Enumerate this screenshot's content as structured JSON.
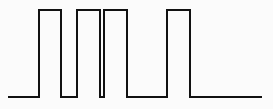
{
  "canvas": {
    "width": 273,
    "height": 109,
    "background_color": "#fbfbfb"
  },
  "figure": {
    "kind": "digital-pulse-waveform",
    "stroke_color": "#111111",
    "stroke_width": 1.6
  },
  "chart_data": {
    "type": "line",
    "title": "",
    "subtitle": "",
    "xlabel": "",
    "ylabel": "",
    "grid": false,
    "legend": null,
    "axis_visible": false,
    "tick_labels_x": [],
    "tick_labels_y": [],
    "xlim": [
      0,
      273
    ],
    "ylim": [
      0,
      109
    ],
    "levels": {
      "low_y": 97,
      "high_y": 10,
      "low_value": 0,
      "high_value": 1
    },
    "trace_start_x": 8,
    "trace_end_x": 262,
    "pulses": [
      {
        "index": 1,
        "rise_x": 39,
        "fall_x": 61,
        "width_px": 22,
        "narrow": false
      },
      {
        "index": 2,
        "rise_x": 77,
        "fall_x": 100,
        "width_px": 23,
        "narrow": false
      },
      {
        "index": 3,
        "rise_x": 104,
        "fall_x": 127,
        "width_px": 23,
        "narrow": false
      },
      {
        "index": 4,
        "rise_x": 167,
        "fall_x": 190,
        "width_px": 23,
        "narrow": false
      }
    ],
    "gaps": [
      {
        "from_x": 8,
        "to_x": 39,
        "width_px": 31,
        "note": "leading low baseline"
      },
      {
        "from_x": 61,
        "to_x": 77,
        "width_px": 16,
        "note": "low between pulse 1 and 2"
      },
      {
        "from_x": 100,
        "to_x": 104,
        "width_px": 4,
        "note": "narrow notch between pulse 2 and 3"
      },
      {
        "from_x": 127,
        "to_x": 167,
        "width_px": 40,
        "note": "wide low between pulse 3 and 4"
      },
      {
        "from_x": 190,
        "to_x": 262,
        "width_px": 72,
        "note": "trailing low baseline"
      }
    ],
    "x": [
      8,
      39,
      39,
      61,
      61,
      77,
      77,
      100,
      100,
      104,
      104,
      127,
      127,
      167,
      167,
      190,
      190,
      262
    ],
    "y": [
      97,
      97,
      10,
      10,
      97,
      97,
      10,
      10,
      97,
      97,
      10,
      10,
      97,
      97,
      10,
      10,
      97,
      97
    ],
    "path_d": "M 8 97 L 39 97 L 39 10 L 61 10 L 61 97 L 77 97 L 77 10 L 100 10 L 100 97 L 104 97 L 104 10 L 127 10 L 127 97 L 167 97 L 167 10 L 190 10 L 190 97 L 262 97"
  }
}
